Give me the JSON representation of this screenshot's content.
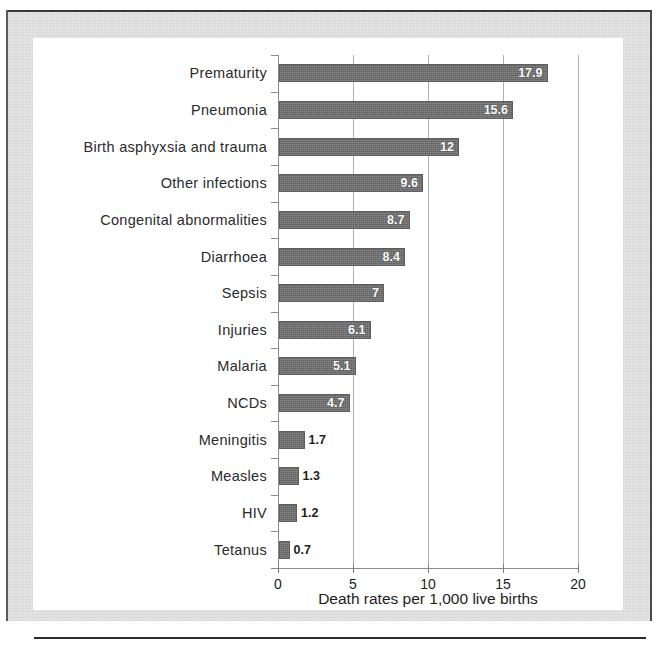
{
  "chart_data": {
    "type": "bar",
    "orientation": "horizontal",
    "title": "",
    "xlabel": "Death rates per 1,000 live births",
    "ylabel": "",
    "xlim": [
      0,
      20
    ],
    "xticks": [
      "0",
      "5",
      "10",
      "15",
      "20"
    ],
    "grid": "vertical",
    "legend": "none",
    "bar_color": "#6d6d6d",
    "categories": [
      "Prematurity",
      "Pneumonia",
      "Birth asphyxsia and trauma",
      "Other infections",
      "Congenital abnormalities",
      "Diarrhoea",
      "Sepsis",
      "Injuries",
      "Malaria",
      "NCDs",
      "Meningitis",
      "Measles",
      "HIV",
      "Tetanus"
    ],
    "values": [
      17.9,
      15.6,
      12,
      9.6,
      8.7,
      8.4,
      7,
      6.1,
      5.1,
      4.7,
      1.7,
      1.3,
      1.2,
      0.7
    ],
    "value_labels": [
      "17.9",
      "15.6",
      "12",
      "9.6",
      "8.7",
      "8.4",
      "7",
      "6.1",
      "5.1",
      "4.7",
      "1.7",
      "1.3",
      "1.2",
      "0.7"
    ],
    "label_placement": [
      "inside",
      "inside",
      "inside",
      "inside",
      "inside",
      "inside",
      "inside",
      "inside",
      "inside",
      "inside",
      "outside",
      "outside",
      "outside",
      "outside"
    ]
  }
}
